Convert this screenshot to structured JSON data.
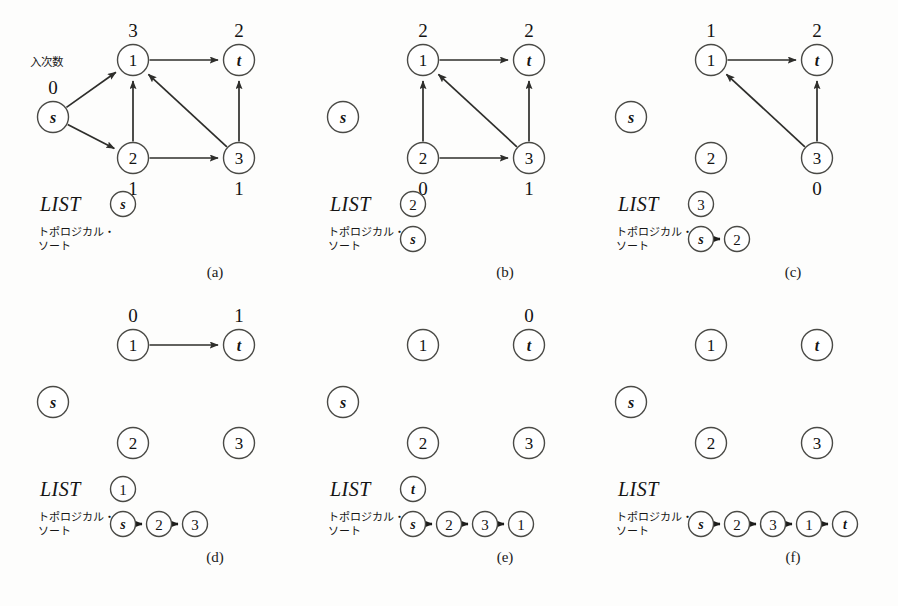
{
  "figure": {
    "title_note": "入次数",
    "list_word": "LIST",
    "topo_line1": "トポロジカル・",
    "topo_line2": "ソート",
    "ink_color": "#2e2e2b",
    "node_fill": "#ffffff",
    "background": "#fdfdfc"
  },
  "panels": [
    {
      "id": "a",
      "caption": "(a)",
      "annotation": "入次数",
      "list_word": "LIST",
      "list_items": [
        "s"
      ],
      "topo_line1": "トポロジカル・",
      "topo_line2": "ソート",
      "sequence": [],
      "nodes": [
        {
          "id": "s",
          "label": "s",
          "italic": true,
          "indegree": "0",
          "indeg_pos": "above"
        },
        {
          "id": "1",
          "label": "1",
          "italic": false,
          "indegree": "3",
          "indeg_pos": "above"
        },
        {
          "id": "t",
          "label": "t",
          "italic": true,
          "indegree": "2",
          "indeg_pos": "above"
        },
        {
          "id": "2",
          "label": "2",
          "italic": false,
          "indegree": "1",
          "indeg_pos": "below"
        },
        {
          "id": "3",
          "label": "3",
          "italic": false,
          "indegree": "1",
          "indeg_pos": "below"
        }
      ],
      "edges": [
        {
          "from": "s",
          "to": "1"
        },
        {
          "from": "s",
          "to": "2"
        },
        {
          "from": "2",
          "to": "1"
        },
        {
          "from": "2",
          "to": "3"
        },
        {
          "from": "3",
          "to": "1"
        },
        {
          "from": "3",
          "to": "t"
        },
        {
          "from": "1",
          "to": "t"
        }
      ]
    },
    {
      "id": "b",
      "caption": "(b)",
      "annotation": "",
      "list_word": "LIST",
      "list_items": [
        "2"
      ],
      "topo_line1": "トポロジカル・",
      "topo_line2": "ソート",
      "sequence": [
        "s"
      ],
      "nodes": [
        {
          "id": "s",
          "label": "s",
          "italic": true,
          "indegree": "",
          "indeg_pos": "above"
        },
        {
          "id": "1",
          "label": "1",
          "italic": false,
          "indegree": "2",
          "indeg_pos": "above"
        },
        {
          "id": "t",
          "label": "t",
          "italic": true,
          "indegree": "2",
          "indeg_pos": "above"
        },
        {
          "id": "2",
          "label": "2",
          "italic": false,
          "indegree": "0",
          "indeg_pos": "below"
        },
        {
          "id": "3",
          "label": "3",
          "italic": false,
          "indegree": "1",
          "indeg_pos": "below"
        }
      ],
      "edges": [
        {
          "from": "2",
          "to": "1"
        },
        {
          "from": "2",
          "to": "3"
        },
        {
          "from": "3",
          "to": "1"
        },
        {
          "from": "3",
          "to": "t"
        },
        {
          "from": "1",
          "to": "t"
        }
      ]
    },
    {
      "id": "c",
      "caption": "(c)",
      "annotation": "",
      "list_word": "LIST",
      "list_items": [
        "3"
      ],
      "topo_line1": "トポロジカル・",
      "topo_line2": "ソート",
      "sequence": [
        "s",
        "2"
      ],
      "nodes": [
        {
          "id": "s",
          "label": "s",
          "italic": true,
          "indegree": "",
          "indeg_pos": "above"
        },
        {
          "id": "1",
          "label": "1",
          "italic": false,
          "indegree": "1",
          "indeg_pos": "above"
        },
        {
          "id": "t",
          "label": "t",
          "italic": true,
          "indegree": "2",
          "indeg_pos": "above"
        },
        {
          "id": "2",
          "label": "2",
          "italic": false,
          "indegree": "",
          "indeg_pos": "below"
        },
        {
          "id": "3",
          "label": "3",
          "italic": false,
          "indegree": "0",
          "indeg_pos": "below"
        }
      ],
      "edges": [
        {
          "from": "3",
          "to": "1"
        },
        {
          "from": "3",
          "to": "t"
        },
        {
          "from": "1",
          "to": "t"
        }
      ]
    },
    {
      "id": "d",
      "caption": "(d)",
      "annotation": "",
      "list_word": "LIST",
      "list_items": [
        "1"
      ],
      "topo_line1": "トポロジカル・",
      "topo_line2": "ソート",
      "sequence": [
        "s",
        "2",
        "3"
      ],
      "nodes": [
        {
          "id": "s",
          "label": "s",
          "italic": true,
          "indegree": "",
          "indeg_pos": "above"
        },
        {
          "id": "1",
          "label": "1",
          "italic": false,
          "indegree": "0",
          "indeg_pos": "above"
        },
        {
          "id": "t",
          "label": "t",
          "italic": true,
          "indegree": "1",
          "indeg_pos": "above"
        },
        {
          "id": "2",
          "label": "2",
          "italic": false,
          "indegree": "",
          "indeg_pos": "below"
        },
        {
          "id": "3",
          "label": "3",
          "italic": false,
          "indegree": "",
          "indeg_pos": "below"
        }
      ],
      "edges": [
        {
          "from": "1",
          "to": "t"
        }
      ]
    },
    {
      "id": "e",
      "caption": "(e)",
      "annotation": "",
      "list_word": "LIST",
      "list_items": [
        "t"
      ],
      "topo_line1": "トポロジカル・",
      "topo_line2": "ソート",
      "sequence": [
        "s",
        "2",
        "3",
        "1"
      ],
      "nodes": [
        {
          "id": "s",
          "label": "s",
          "italic": true,
          "indegree": "",
          "indeg_pos": "above"
        },
        {
          "id": "1",
          "label": "1",
          "italic": false,
          "indegree": "",
          "indeg_pos": "above"
        },
        {
          "id": "t",
          "label": "t",
          "italic": true,
          "indegree": "0",
          "indeg_pos": "above"
        },
        {
          "id": "2",
          "label": "2",
          "italic": false,
          "indegree": "",
          "indeg_pos": "below"
        },
        {
          "id": "3",
          "label": "3",
          "italic": false,
          "indegree": "",
          "indeg_pos": "below"
        }
      ],
      "edges": []
    },
    {
      "id": "f",
      "caption": "(f)",
      "annotation": "",
      "list_word": "LIST",
      "list_items": [],
      "topo_line1": "トポロジカル・",
      "topo_line2": "ソート",
      "sequence": [
        "s",
        "2",
        "3",
        "1",
        "t"
      ],
      "nodes": [
        {
          "id": "s",
          "label": "s",
          "italic": true,
          "indegree": "",
          "indeg_pos": "above"
        },
        {
          "id": "1",
          "label": "1",
          "italic": false,
          "indegree": "",
          "indeg_pos": "above"
        },
        {
          "id": "t",
          "label": "t",
          "italic": true,
          "indegree": "",
          "indeg_pos": "above"
        },
        {
          "id": "2",
          "label": "2",
          "italic": false,
          "indegree": "",
          "indeg_pos": "below"
        },
        {
          "id": "3",
          "label": "3",
          "italic": false,
          "indegree": "",
          "indeg_pos": "below"
        }
      ],
      "edges": []
    }
  ]
}
